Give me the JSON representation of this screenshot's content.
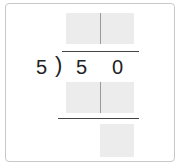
{
  "problem": {
    "divisor": "5",
    "bracket": ")",
    "dividend_digits": [
      "5",
      "0"
    ]
  },
  "answer_boxes": {
    "quotient": {
      "cells": 2,
      "values": [
        "",
        ""
      ]
    },
    "first_product": {
      "cells": 2,
      "values": [
        "",
        ""
      ]
    },
    "remainder": {
      "cells": 1,
      "values": [
        ""
      ]
    }
  },
  "colors": {
    "box_fill": "#ececec",
    "border": "#c8c8c8",
    "line": "#444444",
    "text": "#222222"
  }
}
